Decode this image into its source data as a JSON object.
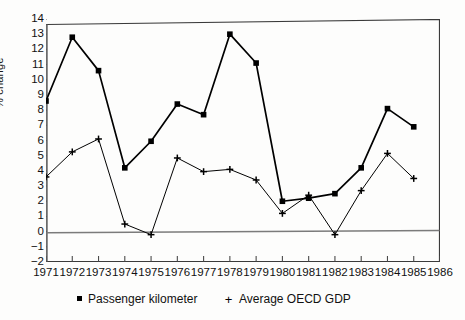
{
  "chart_data": {
    "type": "line",
    "title": "",
    "xlabel": "",
    "ylabel": "% change",
    "x": [
      1971,
      1972,
      1973,
      1974,
      1975,
      1976,
      1977,
      1978,
      1979,
      1980,
      1981,
      1982,
      1983,
      1984,
      1985
    ],
    "xlim": [
      1971,
      1986
    ],
    "ylim": [
      -2,
      14
    ],
    "xticks": [
      "1971",
      "1972",
      "1973",
      "1974",
      "1975",
      "1976",
      "1977",
      "1978",
      "1979",
      "1980",
      "1981",
      "1982",
      "1983",
      "1984",
      "1985",
      "1986"
    ],
    "xtick_values": [
      1971,
      1972,
      1973,
      1974,
      1975,
      1976,
      1977,
      1978,
      1979,
      1980,
      1981,
      1982,
      1983,
      1984,
      1985,
      1986
    ],
    "yticks": [
      "14",
      "13",
      "12",
      "11",
      "10",
      "9",
      "8",
      "7",
      "6",
      "5",
      "4",
      "3",
      "2",
      "1",
      "0",
      "−1",
      "−2"
    ],
    "ytick_values": [
      14,
      13,
      12,
      11,
      10,
      9,
      8,
      7,
      6,
      5,
      4,
      3,
      2,
      1,
      0,
      -1,
      -2
    ],
    "grid": false,
    "zero_line": true,
    "legend_position": "below-axis",
    "series": [
      {
        "name": "Passenger kilometer",
        "marker": "square",
        "color": "#000000",
        "values": [
          8.6,
          12.8,
          10.6,
          4.2,
          5.95,
          8.4,
          7.7,
          13.0,
          11.1,
          2.0,
          2.2,
          2.5,
          4.2,
          8.1,
          6.9
        ]
      },
      {
        "name": "Average OECD GDP",
        "marker": "plus",
        "color": "#000000",
        "values": [
          3.6,
          5.25,
          6.1,
          0.5,
          -0.2,
          4.85,
          3.95,
          4.1,
          3.4,
          1.2,
          2.4,
          -0.2,
          2.7,
          5.15,
          3.5
        ]
      }
    ]
  },
  "axes": {
    "y_title": "% change"
  },
  "legend": {
    "entries": [
      {
        "label": "Passenger kilometer",
        "marker": "square-marker-icon"
      },
      {
        "label": "Average OECD GDP",
        "marker": "plus-marker-icon"
      }
    ]
  }
}
